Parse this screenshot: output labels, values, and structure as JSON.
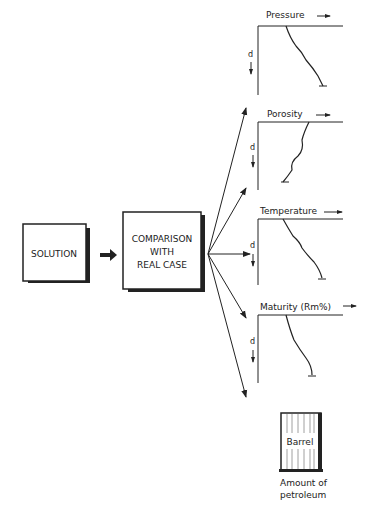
{
  "boxes": {
    "solution": "SOLUTION",
    "comparison": [
      "COMPARISON",
      "WITH",
      "REAL CASE"
    ]
  },
  "plots": [
    {
      "title": "Pressure",
      "axis": "d"
    },
    {
      "title": "Porosity",
      "axis": "d"
    },
    {
      "title": "Temperature",
      "axis": "d"
    },
    {
      "title": "Maturity (Rm%)",
      "axis": "d"
    }
  ],
  "barrel": {
    "label": "Barrel",
    "caption": [
      "Amount of",
      "petroleum"
    ]
  }
}
